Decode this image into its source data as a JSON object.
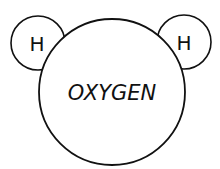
{
  "diagram": {
    "central_atom": {
      "label": "OXYGEN",
      "cx": 112,
      "cy": 92,
      "r": 73
    },
    "hydrogens": [
      {
        "label": "H",
        "cx": 38,
        "cy": 43,
        "r": 27
      },
      {
        "label": "H",
        "cx": 184,
        "cy": 42,
        "r": 27
      }
    ],
    "colors": {
      "stroke": "#111111",
      "fill": "#ffffff"
    }
  }
}
